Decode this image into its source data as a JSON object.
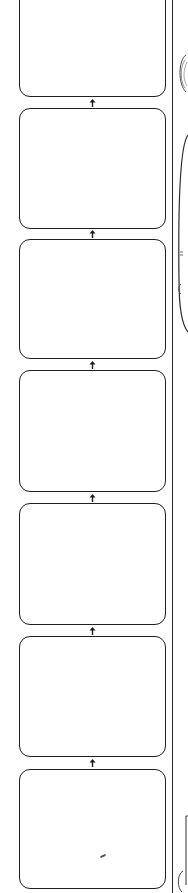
{
  "diagram": {
    "type": "storyboard-flow",
    "direction": "bottom-to-top",
    "frames": [
      {
        "id": 1,
        "top": -12,
        "bottom": 97,
        "label": ""
      },
      {
        "id": 2,
        "top": 108,
        "bottom": 229,
        "label": ""
      },
      {
        "id": 3,
        "top": 239,
        "bottom": 359,
        "label": ""
      },
      {
        "id": 4,
        "top": 370,
        "bottom": 492,
        "label": ""
      },
      {
        "id": 5,
        "top": 503,
        "bottom": 625,
        "label": ""
      },
      {
        "id": 6,
        "top": 636,
        "bottom": 757,
        "label": ""
      },
      {
        "id": 7,
        "top": 769,
        "bottom": 889,
        "label": ""
      }
    ],
    "arrows": [
      {
        "from": 2,
        "to": 1,
        "y": 99
      },
      {
        "from": 3,
        "to": 2,
        "y": 230
      },
      {
        "from": 4,
        "to": 3,
        "y": 361
      },
      {
        "from": 5,
        "to": 4,
        "y": 494
      },
      {
        "from": 6,
        "to": 5,
        "y": 627
      },
      {
        "from": 7,
        "to": 6,
        "y": 759
      }
    ],
    "colors": {
      "line": "#1e1e1e",
      "background": "#ffffff"
    }
  }
}
